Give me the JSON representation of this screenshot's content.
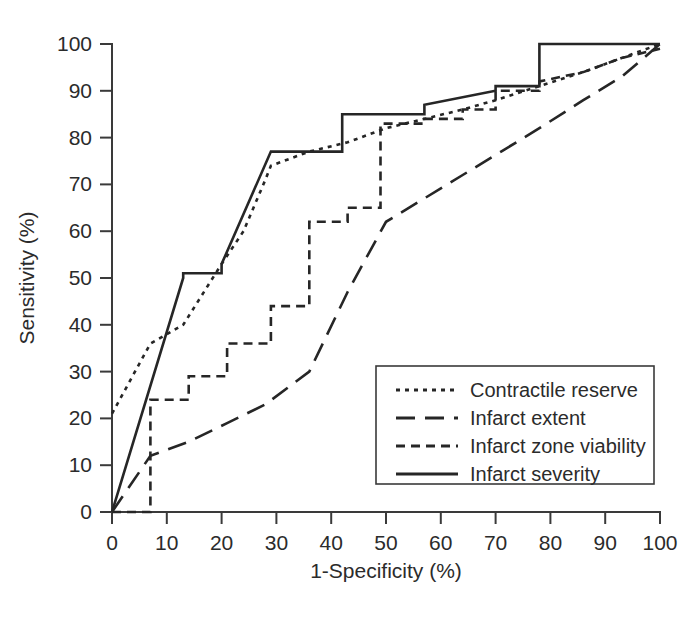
{
  "chart_data": {
    "type": "line",
    "title": "",
    "xlabel": "1-Specificity (%)",
    "ylabel": "Sensitivity (%)",
    "xlim": [
      0,
      100
    ],
    "ylim": [
      0,
      100
    ],
    "xticks": [
      0,
      10,
      20,
      30,
      40,
      50,
      60,
      70,
      80,
      90,
      100
    ],
    "yticks": [
      0,
      10,
      20,
      30,
      40,
      50,
      60,
      70,
      80,
      90,
      100
    ],
    "grid": false,
    "legend_position": "lower right",
    "series": [
      {
        "name": "Contractile reserve",
        "linestyle": "dotted",
        "color": "#262626",
        "points": [
          [
            0,
            21
          ],
          [
            7,
            36
          ],
          [
            13,
            40
          ],
          [
            20,
            53
          ],
          [
            24,
            60
          ],
          [
            28,
            71
          ],
          [
            29,
            74
          ],
          [
            36,
            77
          ],
          [
            43,
            79
          ],
          [
            50,
            82
          ],
          [
            57,
            84
          ],
          [
            64,
            86
          ],
          [
            70,
            88
          ],
          [
            78,
            91
          ],
          [
            86,
            94
          ],
          [
            93,
            97
          ],
          [
            100,
            100
          ]
        ]
      },
      {
        "name": "Infarct extent",
        "linestyle": "long-dash",
        "color": "#262626",
        "points": [
          [
            0,
            0
          ],
          [
            7,
            12
          ],
          [
            14,
            15
          ],
          [
            21,
            19
          ],
          [
            28,
            23
          ],
          [
            36,
            30
          ],
          [
            43,
            47
          ],
          [
            50,
            62
          ],
          [
            57,
            67
          ],
          [
            64,
            72
          ],
          [
            71,
            77
          ],
          [
            78,
            82
          ],
          [
            86,
            88
          ],
          [
            93,
            93
          ],
          [
            100,
            100
          ]
        ]
      },
      {
        "name": "Infarct zone viability",
        "linestyle": "dash",
        "color": "#262626",
        "points": [
          [
            0,
            0
          ],
          [
            7,
            0
          ],
          [
            7,
            24
          ],
          [
            14,
            24
          ],
          [
            14,
            29
          ],
          [
            21,
            29
          ],
          [
            21,
            36
          ],
          [
            29,
            36
          ],
          [
            29,
            44
          ],
          [
            36,
            44
          ],
          [
            36,
            62
          ],
          [
            43,
            62
          ],
          [
            43,
            65
          ],
          [
            49,
            65
          ],
          [
            49,
            83
          ],
          [
            57,
            83
          ],
          [
            57,
            84
          ],
          [
            64,
            84
          ],
          [
            64,
            86
          ],
          [
            70,
            86
          ],
          [
            70,
            90
          ],
          [
            78,
            90
          ],
          [
            78,
            92
          ],
          [
            86,
            94
          ],
          [
            93,
            97
          ],
          [
            100,
            99
          ]
        ]
      },
      {
        "name": "Infarct severity",
        "linestyle": "solid",
        "color": "#262626",
        "points": [
          [
            0,
            0
          ],
          [
            13,
            50
          ],
          [
            13,
            51
          ],
          [
            20,
            51
          ],
          [
            20,
            53
          ],
          [
            29,
            77
          ],
          [
            42,
            77
          ],
          [
            42,
            85
          ],
          [
            57,
            85
          ],
          [
            57,
            87
          ],
          [
            70,
            90
          ],
          [
            70,
            91
          ],
          [
            78,
            91
          ],
          [
            78,
            100
          ],
          [
            100,
            100
          ]
        ]
      }
    ]
  },
  "axes": {
    "x_tick_labels": [
      "0",
      "10",
      "20",
      "30",
      "40",
      "50",
      "60",
      "70",
      "80",
      "90",
      "100"
    ],
    "y_tick_labels": [
      "0",
      "10",
      "20",
      "30",
      "40",
      "50",
      "60",
      "70",
      "80",
      "90",
      "100"
    ],
    "x_title": "1-Specificity (%)",
    "y_title": "Sensitivity (%)"
  },
  "legend": {
    "items": [
      {
        "label": "Contractile reserve",
        "style": "dotted"
      },
      {
        "label": "Infarct extent",
        "style": "long-dash"
      },
      {
        "label": "Infarct zone viability",
        "style": "dash"
      },
      {
        "label": "Infarct severity",
        "style": "solid"
      }
    ]
  },
  "colors": {
    "ink": "#262626",
    "axis": "#3a3a3a",
    "background": "#ffffff"
  }
}
